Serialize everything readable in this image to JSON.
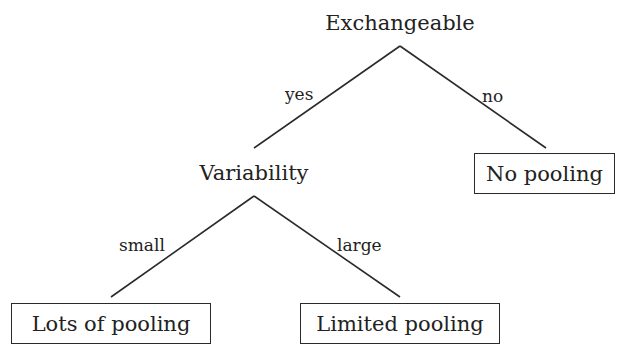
{
  "diagram": {
    "type": "decision-tree",
    "root": {
      "label": "Exchangeable"
    },
    "edges": {
      "yes": "yes",
      "no": "no",
      "small": "small",
      "large": "large"
    },
    "internal": {
      "variability": "Variability"
    },
    "leaves": {
      "no_pooling": "No pooling",
      "lots_of_pooling": "Lots of pooling",
      "limited_pooling": "Limited pooling"
    },
    "colors": {
      "background": "#ffffff",
      "line": "#2a2a2a",
      "text": "#222222"
    },
    "structure": [
      {
        "from": "Exchangeable",
        "to": "Variability",
        "label": "yes"
      },
      {
        "from": "Exchangeable",
        "to": "No pooling",
        "label": "no"
      },
      {
        "from": "Variability",
        "to": "Lots of pooling",
        "label": "small"
      },
      {
        "from": "Variability",
        "to": "Limited pooling",
        "label": "large"
      }
    ]
  }
}
